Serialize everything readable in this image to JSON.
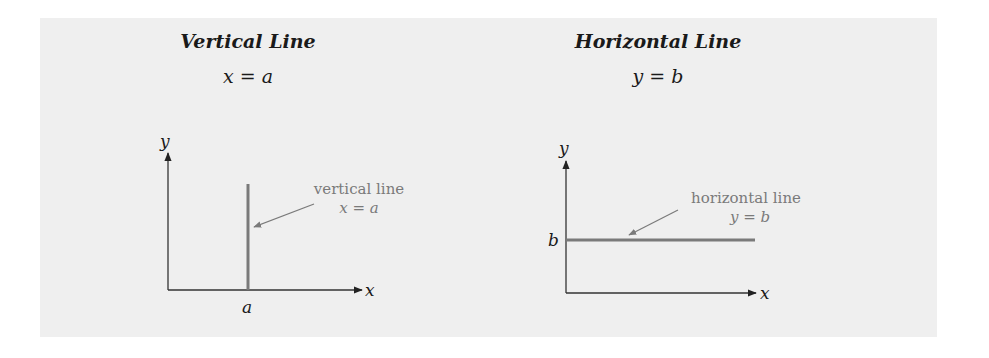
{
  "figure": {
    "background_color": "#efefef",
    "line_color": "#7a7a7a",
    "axis_color": "#333333",
    "panels": [
      {
        "title": "Vertical Line",
        "equation": "x = a",
        "axes": {
          "x_label": "x",
          "y_label": "y"
        },
        "tick_label": "a",
        "annotation": {
          "text": "vertical line",
          "equation": "x = a"
        }
      },
      {
        "title": "Horizontal Line",
        "equation": "y = b",
        "axes": {
          "x_label": "x",
          "y_label": "y"
        },
        "tick_label": "b",
        "annotation": {
          "text": "horizontal line",
          "equation": "y = b"
        }
      }
    ]
  }
}
